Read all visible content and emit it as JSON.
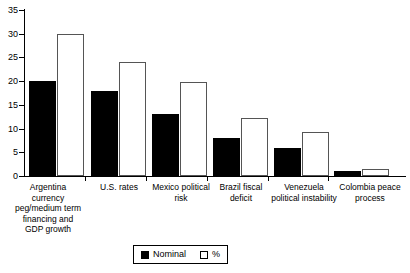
{
  "chart_data": {
    "type": "bar",
    "title": "",
    "subtitle": "",
    "xlabel": "",
    "ylabel": "",
    "ylim": [
      0,
      35
    ],
    "yticks": [
      0,
      5,
      10,
      15,
      20,
      25,
      30,
      35
    ],
    "ytick_labels": [
      "0",
      "5",
      "10",
      "15",
      "20",
      "25",
      "30",
      "35"
    ],
    "grid": false,
    "legend_position": "bottom-center",
    "categories": [
      "Argentina\ncurrency\npeg/medium term\nfinancing and\nGDP growth",
      "U.S. rates",
      "Mexico political\nrisk",
      "Brazil fiscal\ndeficit",
      "Venezuela\npolitical instability",
      "Colombia peace\nprocess"
    ],
    "series": [
      {
        "name": "Nominal",
        "color": "#000000",
        "style": "filled",
        "values": [
          20,
          18,
          13,
          8,
          6,
          1
        ]
      },
      {
        "name": "%",
        "color": "#ffffff",
        "style": "open",
        "values": [
          30,
          24,
          19.8,
          12.2,
          9.3,
          1.5
        ]
      }
    ]
  },
  "legend": {
    "items": [
      {
        "label": "Nominal",
        "swatch": "filled-square-icon"
      },
      {
        "label": "%",
        "swatch": "open-square-icon"
      }
    ]
  }
}
